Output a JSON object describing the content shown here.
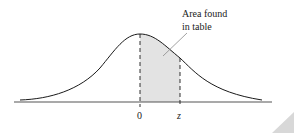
{
  "figure": {
    "annotation_line1": "Area found",
    "annotation_line2": "in table",
    "axis_label_zero": "0",
    "axis_label_z": "z"
  },
  "colors": {
    "curve": "#1a1a1a",
    "shaded_area": "#e3e3e3",
    "axis": "#555555",
    "leader_line": "#8a8a8a"
  }
}
